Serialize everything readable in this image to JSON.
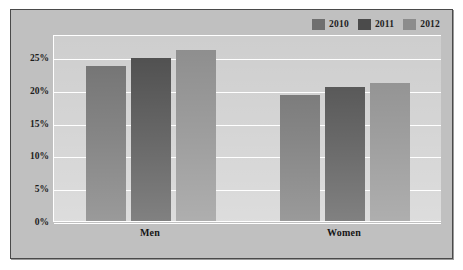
{
  "chart_data": {
    "type": "bar",
    "title": "",
    "subtitle": "",
    "xlabel": "",
    "ylabel": "",
    "categories": [
      "Men",
      "Women"
    ],
    "series": [
      {
        "name": "2010",
        "values": [
          23.8,
          19.4
        ],
        "color": "#6f6f6f"
      },
      {
        "name": "2011",
        "values": [
          25.0,
          20.6
        ],
        "color": "#4b4b4b"
      },
      {
        "name": "2012",
        "values": [
          26.2,
          21.2
        ],
        "color": "#8c8c8c"
      }
    ],
    "ylim": [
      0,
      28.5
    ],
    "yticks": [
      0,
      5,
      10,
      15,
      20,
      25
    ],
    "ytick_labels": [
      "0%",
      "5%",
      "10%",
      "15%",
      "20%",
      "25%"
    ],
    "grid": true,
    "grid_color": "#ffffff",
    "legend_position": "top-right",
    "plot_background": "#cecece",
    "canvas_background": "#c0c0c0",
    "frame_color": "#4a4a4a",
    "annotations": []
  },
  "legend": {
    "entries": [
      {
        "label": "2010"
      },
      {
        "label": "2011"
      },
      {
        "label": "2012"
      }
    ]
  },
  "axis": {
    "y_labels": [
      "25%",
      "20%",
      "15%",
      "10%",
      "5%",
      "0%"
    ],
    "x_labels": [
      "Men",
      "Women"
    ]
  }
}
